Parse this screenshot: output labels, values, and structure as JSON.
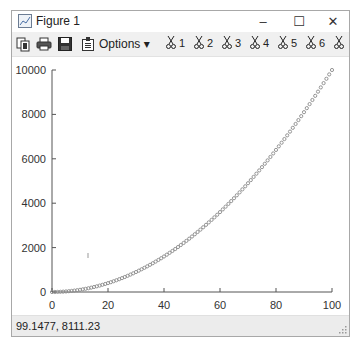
{
  "window": {
    "title": "Figure 1",
    "controls": {
      "minimize": "–",
      "maximize": "☐",
      "close": "✕"
    }
  },
  "toolbar": {
    "icons": [
      "copy-icon",
      "print-icon",
      "save-icon",
      "properties-icon"
    ],
    "options_label": "Options ▾",
    "cut_buttons": [
      {
        "label": "1"
      },
      {
        "label": "2"
      },
      {
        "label": "3"
      },
      {
        "label": "4"
      },
      {
        "label": "5"
      },
      {
        "label": "6"
      },
      {
        "label": ""
      }
    ]
  },
  "status": {
    "cursor_coords": "99.1477,  8111.23"
  },
  "chart_data": {
    "type": "scatter",
    "title": "",
    "xlabel": "",
    "ylabel": "",
    "function": "y = x^2",
    "x": {
      "start": 0,
      "end": 100,
      "step": 1
    },
    "xlim": [
      0,
      100
    ],
    "ylim": [
      0,
      10000
    ],
    "xticks": [
      0,
      20,
      40,
      60,
      80,
      100
    ],
    "yticks": [
      0,
      2000,
      4000,
      6000,
      8000,
      10000
    ],
    "xtick_labels": [
      "0",
      "20",
      "40",
      "60",
      "80",
      "100"
    ],
    "ytick_labels": [
      "0",
      "2000",
      "4000",
      "6000",
      "8000",
      "10000"
    ],
    "series": [
      {
        "name": "data",
        "marker": "circle",
        "color": "#8a8a8a",
        "sample_points": [
          [
            0,
            0
          ],
          [
            10,
            100
          ],
          [
            20,
            400
          ],
          [
            30,
            900
          ],
          [
            40,
            1600
          ],
          [
            50,
            2500
          ],
          [
            60,
            3600
          ],
          [
            70,
            4900
          ],
          [
            80,
            6400
          ],
          [
            90,
            8100
          ],
          [
            100,
            10000
          ]
        ]
      }
    ],
    "grid": false,
    "legend": false
  }
}
